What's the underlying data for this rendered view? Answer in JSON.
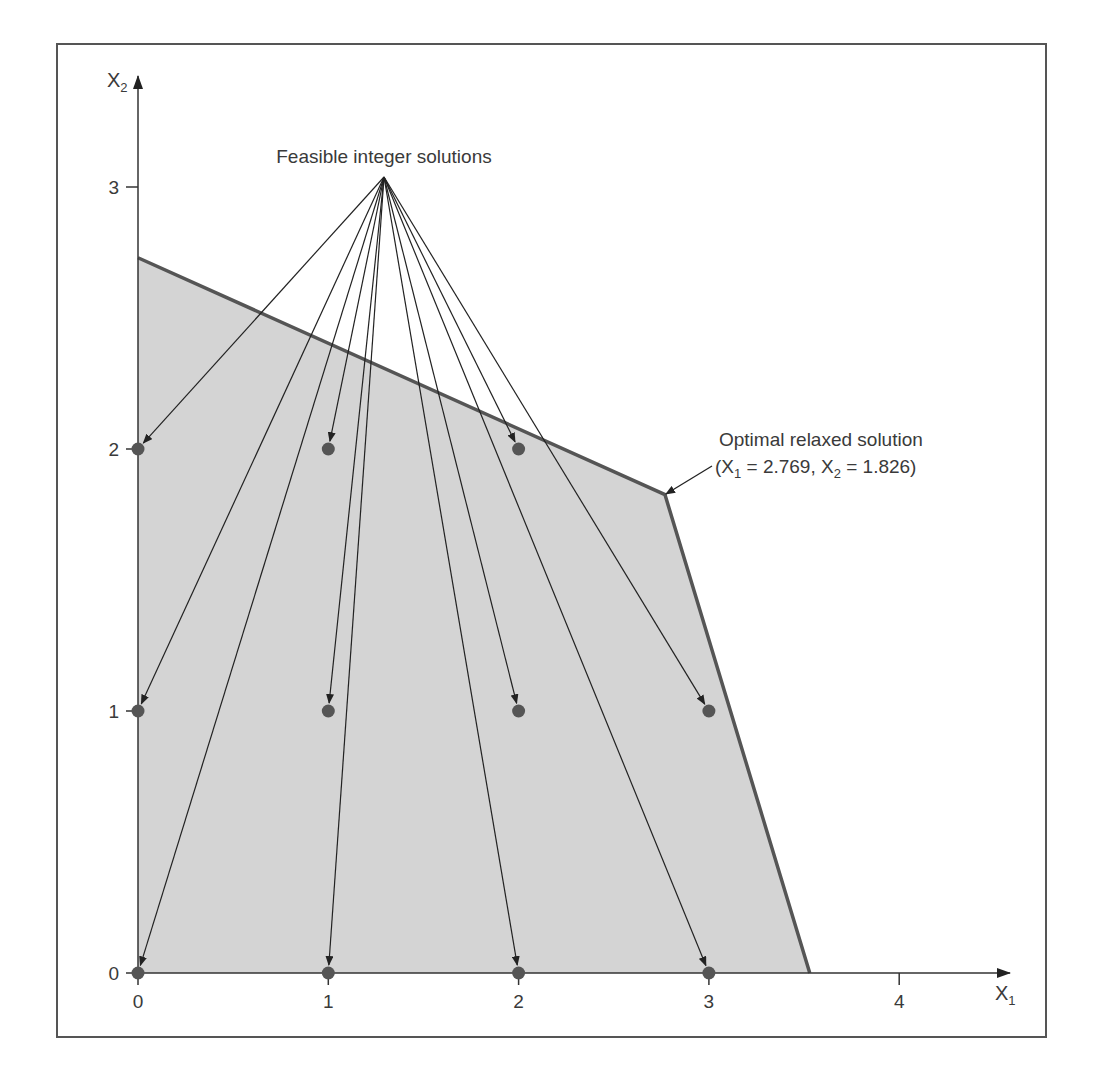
{
  "chart_data": {
    "type": "scatter",
    "title": "",
    "xlabel": "X1",
    "ylabel": "X2",
    "xlim": [
      0,
      4.5
    ],
    "ylim": [
      0,
      3.4
    ],
    "x_ticks": [
      0,
      1,
      2,
      3,
      4
    ],
    "y_ticks": [
      0,
      1,
      2,
      3
    ],
    "grid": false,
    "legend": null,
    "feasible_region": {
      "description": "Shaded feasible region (LP relaxation)",
      "vertices": [
        [
          0,
          0
        ],
        [
          0,
          2.73
        ],
        [
          2.769,
          1.826
        ],
        [
          3.53,
          0
        ]
      ],
      "fill": "#d4d4d4",
      "edge": "#555555"
    },
    "series": [
      {
        "name": "Feasible integer solutions",
        "points": [
          [
            0,
            0
          ],
          [
            1,
            0
          ],
          [
            2,
            0
          ],
          [
            3,
            0
          ],
          [
            0,
            1
          ],
          [
            1,
            1
          ],
          [
            2,
            1
          ],
          [
            3,
            1
          ],
          [
            0,
            2
          ],
          [
            1,
            2
          ],
          [
            2,
            2
          ]
        ]
      }
    ],
    "annotations": [
      {
        "text": "Feasible integer solutions",
        "points_to": "all feasible integer points",
        "anchor": [
          1.3,
          3.03
        ]
      },
      {
        "text_line1": "Optimal relaxed solution",
        "text_line2": "(X1 = 2.769, X2 = 1.826)",
        "points_to": [
          2.769,
          1.826
        ]
      }
    ]
  },
  "labels": {
    "x_axis_main": "X",
    "x_axis_sub": "1",
    "y_axis_main": "X",
    "y_axis_sub": "2",
    "x_ticks": [
      "0",
      "1",
      "2",
      "3",
      "4"
    ],
    "y_ticks": [
      "0",
      "1",
      "2",
      "3"
    ],
    "feasible_label": "Feasible integer solutions",
    "optimal_line1": "Optimal relaxed solution",
    "optimal_line2_a": "(X",
    "optimal_line2_sub1": "1",
    "optimal_line2_b": " = 2.769, X",
    "optimal_line2_sub2": "2",
    "optimal_line2_c": " = 1.826)"
  },
  "colors": {
    "frame": "#555555",
    "axis": "#333333",
    "region_fill": "#d4d4d4",
    "region_edge": "#555555",
    "point": "#555555",
    "arrow": "#222222"
  }
}
